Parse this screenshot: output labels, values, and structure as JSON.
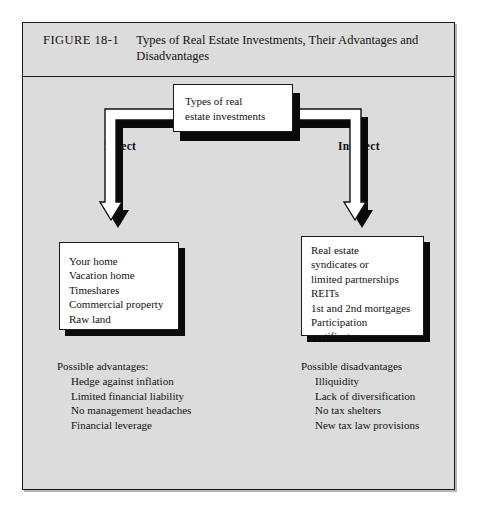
{
  "figure": {
    "number": "FIGURE 18-1",
    "title": "Types of Real Estate Investments, Their Advantages and Disadvantages",
    "frame_color": "#dcdcdc",
    "border_color": "#1c1c1c"
  },
  "diagram": {
    "type": "hierarchy-tree",
    "root_box": {
      "text": "Types of real\nestate investments"
    },
    "branches": [
      {
        "label": "Direct",
        "side": "left",
        "box_items": "Your home\nVacation home\nTimeshares\nCommercial property\nRaw land",
        "note_heading": "Possible advantages:",
        "note_items": "Hedge against inflation\nLimited financial liability\nNo management headaches\nFinancial leverage"
      },
      {
        "label": "Indirect",
        "side": "right",
        "box_items": "Real estate\nsyndicates or\nlimited partnerships\nREITs\n1st and 2nd mortgages\nParticipation\ncertificates",
        "note_heading": "Possible disadvantages",
        "note_items": "Illiquidity\nLack of diversification\nNo tax shelters\nNew tax law provisions"
      }
    ],
    "connector": {
      "style": "drop-shadow-bracket-with-arrows",
      "fill": "#ffffff",
      "stroke": "#111111",
      "shadow": "#0a0a0a"
    }
  }
}
